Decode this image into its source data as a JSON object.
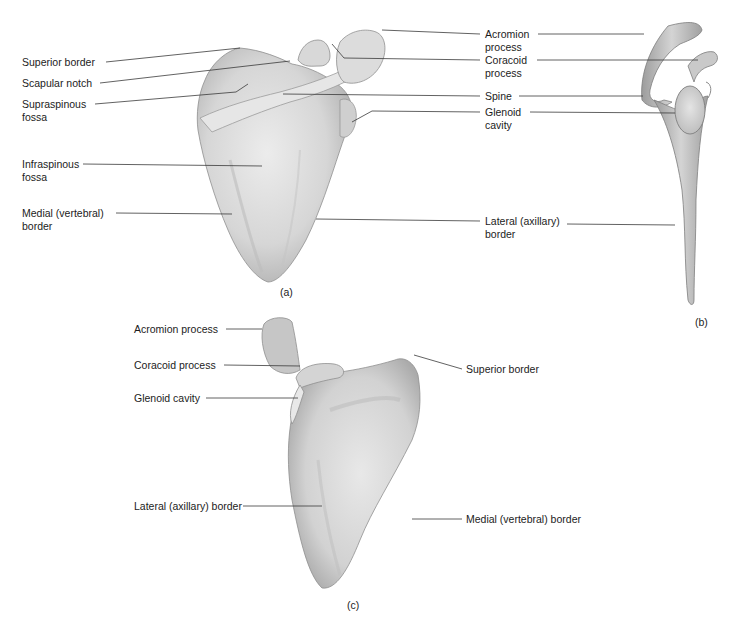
{
  "figure": {
    "bone_color": "#d9d9d9",
    "bone_shadow": "#a8a8a8",
    "leader_color": "#333333",
    "panels": [
      {
        "id": "a",
        "caption": "(a)",
        "labels": [
          {
            "text": "Superior border"
          },
          {
            "text": "Scapular notch"
          },
          {
            "text": "Supraspinous fossa",
            "lines": [
              "Supraspinous",
              "fossa"
            ]
          },
          {
            "text": "Infraspinous fossa",
            "lines": [
              "Infraspinous",
              "fossa"
            ]
          },
          {
            "text": "Medial (vertebral) border",
            "lines": [
              "Medial (vertebral)",
              "border"
            ]
          }
        ]
      },
      {
        "id": "a-right",
        "caption": "",
        "labels": [
          {
            "text": "Acromion process",
            "lines": [
              "Acromion",
              "process"
            ]
          },
          {
            "text": "Coracoid process",
            "lines": [
              "Coracoid",
              "process"
            ]
          },
          {
            "text": "Spine"
          },
          {
            "text": "Glenoid cavity",
            "lines": [
              "Glenoid",
              "cavity"
            ]
          },
          {
            "text": "Lateral (axillary) border",
            "lines": [
              "Lateral (axillary)",
              "border"
            ]
          }
        ]
      },
      {
        "id": "b",
        "caption": "(b)"
      },
      {
        "id": "c",
        "caption": "(c)",
        "labels": [
          {
            "text": "Acromion process"
          },
          {
            "text": "Coracoid process"
          },
          {
            "text": "Glenoid cavity"
          },
          {
            "text": "Lateral (axillary) border"
          },
          {
            "text": "Superior border"
          },
          {
            "text": "Medial (vertebral) border"
          }
        ]
      }
    ]
  }
}
